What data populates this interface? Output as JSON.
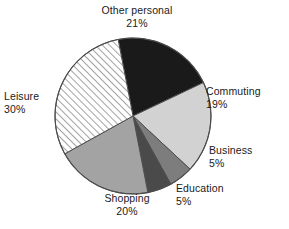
{
  "chart_data": {
    "type": "pie",
    "title": "",
    "categories": [
      "Other personal",
      "Commuting",
      "Business",
      "Education",
      "Shopping",
      "Leisure"
    ],
    "values": [
      21,
      19,
      5,
      5,
      20,
      30
    ],
    "value_suffix": "%",
    "legend": "none",
    "grid": false,
    "start_angle_deg": -11,
    "direction": "clockwise",
    "slices": [
      {
        "label": "Other personal",
        "value": 21,
        "value_text": "21%",
        "fill": "#1a1a1a",
        "pattern": "solid"
      },
      {
        "label": "Commuting",
        "value": 19,
        "value_text": "19%",
        "fill": "#d2d2d2",
        "pattern": "solid"
      },
      {
        "label": "Business",
        "value": 5,
        "value_text": "5%",
        "fill": "#7d7d7d",
        "pattern": "solid"
      },
      {
        "label": "Education",
        "value": 5,
        "value_text": "5%",
        "fill": "#4a4a4a",
        "pattern": "solid"
      },
      {
        "label": "Shopping",
        "value": 20,
        "value_text": "20%",
        "fill": "#a3a3a3",
        "pattern": "solid"
      },
      {
        "label": "Leisure",
        "value": 30,
        "value_text": "30%",
        "fill": "#ffffff",
        "pattern": "diagonal-hatch"
      }
    ],
    "geometry": {
      "center_x": 133,
      "center_y": 116,
      "radius": 78,
      "outline_color": "#4d4d4d"
    }
  }
}
